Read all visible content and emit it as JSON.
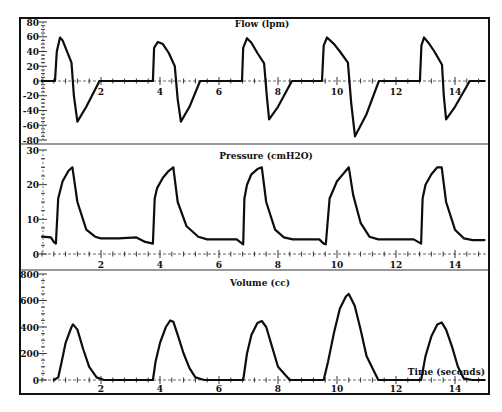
{
  "chart_data": [
    {
      "type": "line",
      "title": "Flow (lpm)",
      "xlabel": "",
      "ylabel": "Flow (lpm)",
      "ylim": [
        -80,
        80
      ],
      "xlim": [
        0,
        15
      ],
      "yticks": [
        80,
        60,
        40,
        20,
        0,
        -20,
        -40,
        -60,
        -80
      ],
      "xticks": [
        2,
        4,
        6,
        8,
        10,
        12,
        14
      ],
      "grid": false,
      "series": [
        {
          "name": "Flow",
          "x": [
            0,
            0.44,
            0.5,
            0.61,
            0.7,
            0.9,
            1.0,
            1.08,
            1.2,
            1.5,
            1.95,
            3.76,
            3.8,
            3.93,
            4.1,
            4.3,
            4.5,
            4.6,
            4.71,
            5.0,
            5.36,
            6.78,
            6.82,
            6.95,
            7.1,
            7.3,
            7.53,
            7.62,
            7.7,
            8.0,
            8.47,
            9.49,
            9.55,
            9.66,
            9.9,
            10.1,
            10.37,
            10.48,
            10.61,
            11.0,
            11.42,
            12.81,
            12.86,
            12.95,
            13.1,
            13.3,
            13.56,
            13.62,
            13.7,
            14.0,
            14.5,
            15.0
          ],
          "values": [
            0,
            0,
            40,
            59,
            55,
            35,
            25,
            -20,
            -55,
            -35,
            0,
            0,
            45,
            53,
            50,
            38,
            20,
            -25,
            -55,
            -35,
            0,
            0,
            45,
            58,
            52,
            38,
            24,
            -20,
            -52,
            -35,
            0,
            0,
            48,
            59,
            50,
            40,
            25,
            -30,
            -75,
            -45,
            0,
            0,
            48,
            59,
            52,
            40,
            22,
            -20,
            -52,
            -35,
            0,
            0
          ]
        }
      ]
    },
    {
      "type": "line",
      "title": "Pressure (cmH2O)",
      "xlabel": "",
      "ylabel": "Pressure (cmH2O)",
      "ylim": [
        0,
        30
      ],
      "xlim": [
        0,
        15
      ],
      "yticks": [
        30,
        20,
        10,
        0
      ],
      "xticks": [
        2,
        4,
        6,
        8,
        10,
        12,
        14
      ],
      "grid": false,
      "series": [
        {
          "name": "Pressure",
          "x": [
            0,
            0.3,
            0.4,
            0.47,
            0.55,
            0.7,
            0.9,
            1.03,
            1.2,
            1.5,
            1.8,
            2.0,
            2.6,
            3.2,
            3.5,
            3.76,
            3.82,
            3.9,
            4.1,
            4.3,
            4.45,
            4.6,
            4.9,
            5.3,
            5.6,
            6.2,
            6.6,
            6.82,
            6.86,
            6.95,
            7.1,
            7.3,
            7.45,
            7.6,
            7.9,
            8.2,
            8.5,
            9.0,
            9.4,
            9.55,
            9.62,
            9.75,
            10.0,
            10.2,
            10.4,
            10.55,
            10.8,
            11.1,
            11.4,
            12.0,
            12.6,
            12.85,
            12.9,
            13.0,
            13.2,
            13.4,
            13.55,
            13.7,
            14.0,
            14.3,
            14.6,
            15.0
          ],
          "values": [
            5,
            4.8,
            3.5,
            3,
            16,
            21,
            24,
            25,
            15,
            7,
            5,
            4.5,
            4.5,
            4.8,
            3.5,
            3,
            16,
            19,
            22,
            24,
            25,
            15,
            8,
            5,
            4.2,
            4.2,
            4.2,
            2.8,
            16,
            20,
            23,
            24.5,
            25,
            15,
            7,
            4.8,
            4.2,
            4.2,
            4.2,
            3,
            2.8,
            16,
            21,
            23,
            25,
            17,
            9,
            5,
            4.2,
            4.2,
            4.2,
            3,
            16,
            20,
            23,
            25,
            25,
            15,
            7,
            4.5,
            4,
            4
          ]
        }
      ]
    },
    {
      "type": "line",
      "title": "Volume (cc)",
      "xlabel": "Time (seconds)",
      "ylabel": "Volume (cc)",
      "ylim": [
        0,
        800
      ],
      "xlim": [
        0,
        15
      ],
      "yticks": [
        800,
        600,
        400,
        200,
        0
      ],
      "xticks": [
        2,
        4,
        6,
        8,
        10,
        12,
        14
      ],
      "grid": false,
      "series": [
        {
          "name": "Volume",
          "x": [
            0.4,
            0.55,
            0.65,
            0.8,
            1.0,
            1.05,
            1.2,
            1.4,
            1.6,
            1.85,
            2.1,
            3.0,
            3.76,
            3.85,
            4.0,
            4.2,
            4.35,
            4.45,
            4.6,
            4.8,
            5.0,
            5.2,
            5.5,
            6.5,
            6.82,
            6.95,
            7.1,
            7.3,
            7.45,
            7.6,
            7.8,
            8.0,
            8.4,
            9.0,
            9.55,
            9.7,
            9.9,
            10.1,
            10.3,
            10.4,
            10.6,
            10.8,
            11.0,
            11.4,
            12.0,
            12.85,
            13.0,
            13.2,
            13.4,
            13.55,
            13.7,
            13.9,
            14.1,
            14.3,
            14.6,
            15.0
          ],
          "values": [
            0,
            20,
            120,
            280,
            400,
            420,
            380,
            230,
            100,
            20,
            0,
            0,
            0,
            140,
            280,
            400,
            450,
            440,
            340,
            200,
            90,
            20,
            0,
            0,
            0,
            200,
            340,
            430,
            445,
            400,
            250,
            100,
            0,
            0,
            0,
            140,
            360,
            540,
            630,
            650,
            560,
            380,
            180,
            0,
            0,
            0,
            180,
            330,
            420,
            435,
            380,
            250,
            100,
            10,
            0,
            0
          ]
        }
      ]
    }
  ],
  "panels": {
    "flow": {
      "title": "Flow (lpm)"
    },
    "pressure": {
      "title": "Pressure (cmH2O)"
    },
    "volume": {
      "title": "Volume (cc)"
    }
  },
  "x_axis_label": "Time (seconds)"
}
